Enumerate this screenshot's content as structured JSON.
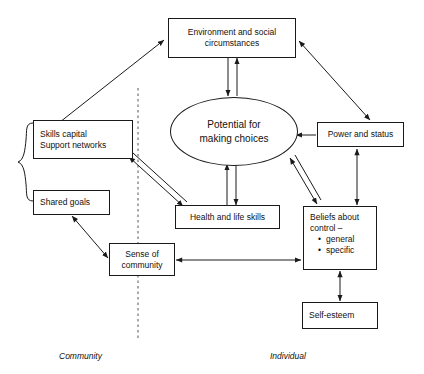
{
  "diagram": {
    "stroke_color": "#1a1a1a",
    "background_color": "#ffffff",
    "divider": {
      "name": "community-individual-divider",
      "style": "dashed-vertical"
    },
    "nodes": [
      {
        "id": "environment",
        "shape": "rectangle",
        "lines": [
          "Environment and social",
          "circumstances"
        ]
      },
      {
        "id": "potential",
        "shape": "ellipse",
        "lines": [
          "Potential for",
          "making choices"
        ]
      },
      {
        "id": "skills-capital",
        "shape": "rectangle",
        "lines": [
          "Skills capital",
          "Support networks"
        ]
      },
      {
        "id": "shared-goals",
        "shape": "rectangle",
        "lines": [
          "Shared goals"
        ]
      },
      {
        "id": "sense-of-community",
        "shape": "rectangle",
        "lines": [
          "Sense of",
          "community"
        ]
      },
      {
        "id": "health-life-skills",
        "shape": "rectangle",
        "lines": [
          "Health and life skills"
        ]
      },
      {
        "id": "power-status",
        "shape": "rectangle",
        "lines": [
          "Power and status"
        ]
      },
      {
        "id": "beliefs-about-control",
        "shape": "rectangle",
        "lines": [
          "Beliefs about",
          "control –"
        ],
        "bullets": [
          "general",
          "specific"
        ]
      },
      {
        "id": "self-esteem",
        "shape": "rectangle",
        "lines": [
          "Self-esteem"
        ]
      }
    ],
    "region_labels": {
      "left": "Community",
      "right": "Individual"
    },
    "edges": [
      {
        "from": "skills-capital",
        "to": "environment",
        "arrows": "single"
      },
      {
        "from": "environment",
        "to": "power-status",
        "arrows": "double"
      },
      {
        "from": "environment",
        "to": "potential",
        "arrows": "down-single"
      },
      {
        "from": "potential",
        "to": "environment",
        "arrows": "up-single"
      },
      {
        "from": "power-status",
        "to": "potential",
        "arrows": "single"
      },
      {
        "from": "power-status",
        "to": "beliefs-about-control",
        "arrows": "double"
      },
      {
        "from": "potential",
        "to": "health-life-skills",
        "arrows": "down-single"
      },
      {
        "from": "health-life-skills",
        "to": "potential",
        "arrows": "up-single"
      },
      {
        "from": "skills-capital",
        "to": "health-life-skills",
        "arrows": "double-line-double-head"
      },
      {
        "from": "potential",
        "to": "beliefs-about-control",
        "arrows": "double-line-double-head"
      },
      {
        "from": "shared-goals",
        "to": "sense-of-community",
        "arrows": "double"
      },
      {
        "from": "sense-of-community",
        "to": "beliefs-about-control",
        "arrows": "double"
      },
      {
        "from": "beliefs-about-control",
        "to": "self-esteem",
        "arrows": "double"
      },
      {
        "from": "brace",
        "to": "skills-capital-shared-goals",
        "arrows": "brace"
      }
    ]
  }
}
